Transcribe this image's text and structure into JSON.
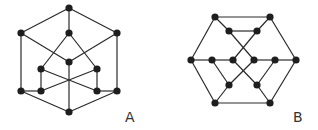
{
  "figure": {
    "colors": {
      "node": "#1e1e1e",
      "edge": "#2a2a2a",
      "label": "#333333",
      "background": "#ffffff"
    },
    "graphs": [
      {
        "id": "A",
        "label": "A",
        "node_count": 12,
        "nodes": [
          "a1",
          "a2",
          "a3",
          "a4",
          "a5",
          "a6",
          "a7",
          "a8",
          "a9",
          "a10",
          "a11",
          "a12"
        ],
        "edges": [
          [
            "a1",
            "a2"
          ],
          [
            "a1",
            "a3"
          ],
          [
            "a1",
            "a4"
          ],
          [
            "a2",
            "a5"
          ],
          [
            "a4",
            "a5"
          ],
          [
            "a2",
            "a8"
          ],
          [
            "a4",
            "a11"
          ],
          [
            "a3",
            "a6"
          ],
          [
            "a3",
            "a7"
          ],
          [
            "a6",
            "a9"
          ],
          [
            "a7",
            "a10"
          ],
          [
            "a6",
            "a10"
          ],
          [
            "a7",
            "a9"
          ],
          [
            "a8",
            "a9"
          ],
          [
            "a10",
            "a11"
          ],
          [
            "a8",
            "a12"
          ],
          [
            "a11",
            "a12"
          ],
          [
            "a5",
            "a12"
          ]
        ]
      },
      {
        "id": "B",
        "label": "B",
        "node_count": 14,
        "nodes": [
          "b1",
          "b2",
          "b3",
          "b4",
          "b5",
          "b6",
          "b7",
          "b8",
          "b9",
          "b10",
          "b11",
          "b12",
          "b13",
          "b14"
        ],
        "edges": [
          [
            "b1",
            "b2"
          ],
          [
            "b1",
            "b3"
          ],
          [
            "b2",
            "b4"
          ],
          [
            "b3",
            "b4"
          ],
          [
            "b1",
            "b5"
          ],
          [
            "b2",
            "b10"
          ],
          [
            "b3",
            "b8"
          ],
          [
            "b4",
            "b7"
          ],
          [
            "b5",
            "b6"
          ],
          [
            "b6",
            "b7"
          ],
          [
            "b8",
            "b9"
          ],
          [
            "b9",
            "b10"
          ],
          [
            "b7",
            "b12"
          ],
          [
            "b8",
            "b11"
          ],
          [
            "b6",
            "b11"
          ],
          [
            "b9",
            "b12"
          ],
          [
            "b5",
            "b13"
          ],
          [
            "b10",
            "b14"
          ],
          [
            "b11",
            "b13"
          ],
          [
            "b12",
            "b14"
          ],
          [
            "b13",
            "b14"
          ]
        ]
      }
    ]
  }
}
